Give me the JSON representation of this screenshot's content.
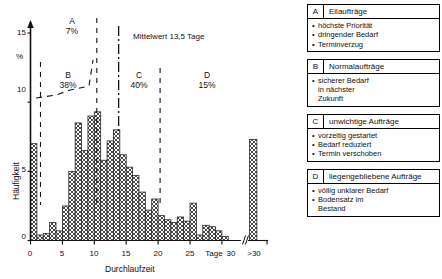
{
  "chart_data": {
    "type": "bar",
    "title": "",
    "xlabel": "Durchlaufzeit",
    "ylabel": "Häufigkeit",
    "yunit": "%",
    "xunit": "Tage",
    "ylim": [
      0,
      16
    ],
    "yticks": [
      0,
      5,
      10,
      15
    ],
    "xticks": [
      0,
      5,
      10,
      15,
      20,
      25,
      30
    ],
    "xtick_labels": [
      "0",
      "5",
      "10",
      "15",
      "20",
      "25",
      "30"
    ],
    "xaxis_break_label": ">30",
    "grid": false,
    "legend_position": "none",
    "categories": [
      0,
      1,
      2,
      3,
      4,
      5,
      6,
      7,
      8,
      9,
      10,
      11,
      12,
      13,
      14,
      15,
      16,
      17,
      18,
      19,
      20,
      21,
      22,
      23,
      24,
      25,
      26,
      27,
      28,
      29,
      30
    ],
    "values": [
      7.0,
      0.4,
      0.5,
      1.3,
      0.7,
      2.5,
      5.0,
      8.5,
      6.5,
      9.0,
      9.3,
      5.8,
      7.2,
      8.0,
      6.2,
      5.3,
      4.7,
      3.5,
      2.2,
      3.0,
      1.8,
      1.5,
      1.3,
      1.7,
      1.4,
      2.7,
      0.4,
      1.1,
      1.0,
      0.7,
      0.3
    ],
    "overflow_bar": {
      "label": ">30",
      "value": 7.3
    },
    "mean": {
      "value": 13.5,
      "unit": "Tage",
      "label": "Mittelwert 13,5 Tage"
    },
    "segments": [
      {
        "key": "A",
        "label": "A",
        "share": "7%",
        "range": [
          0,
          10
        ]
      },
      {
        "key": "B",
        "label": "B",
        "share": "38%",
        "range": [
          0,
          10
        ]
      },
      {
        "key": "C",
        "label": "C",
        "share": "40%",
        "range": [
          10,
          20
        ]
      },
      {
        "key": "D",
        "label": "D",
        "share": "15%",
        "range": [
          20,
          31
        ]
      }
    ]
  },
  "legend": {
    "boxes": [
      {
        "key": "A",
        "title": "Eilaufträge",
        "items": [
          "höchste Priorität",
          "dringender Bedarf",
          "Terminverzug"
        ]
      },
      {
        "key": "B",
        "title": "Normalaufträge",
        "items": [
          "sicherer Bedarf"
        ],
        "cont": [
          "in nächster",
          "Zukunft"
        ]
      },
      {
        "key": "C",
        "title": "unwichtige Aufträge",
        "items": [
          "vorzeitig gestartet",
          "Bedarf reduziert",
          "Termin verschoben"
        ]
      },
      {
        "key": "D",
        "title": "liegengebliebene Aufträge",
        "items": [
          "völlig unklarer Bedarf",
          "Bodensatz im"
        ],
        "cont": [
          "Bestand"
        ]
      }
    ],
    "bullet": "•"
  },
  "axis": {
    "y_tick_0": "0",
    "y_tick_5": "5",
    "y_tick_10": "10",
    "y_tick_15": "15",
    "y_unit": "%",
    "y_title": "Häufigkeit",
    "x_tick_0": "0",
    "x_tick_5": "5",
    "x_tick_10": "10",
    "x_tick_15": "15",
    "x_tick_20": "20",
    "x_tick_25": "25",
    "x_tick_30": "30",
    "x_unit": "Tage",
    "x_overflow": ">30",
    "x_title": "Durchlaufzeit"
  },
  "segment_text": {
    "a_letter": "A",
    "a_share": "7%",
    "b_letter": "B",
    "b_share": "38%",
    "c_letter": "C",
    "c_share": "40%",
    "d_letter": "D",
    "d_share": "15%",
    "mean_label": "Mittelwert 13,5 Tage"
  },
  "colors": {
    "ink": "#111111",
    "bar_fill": "#d9d9d9",
    "bar_stroke": "#1a1a1a"
  }
}
